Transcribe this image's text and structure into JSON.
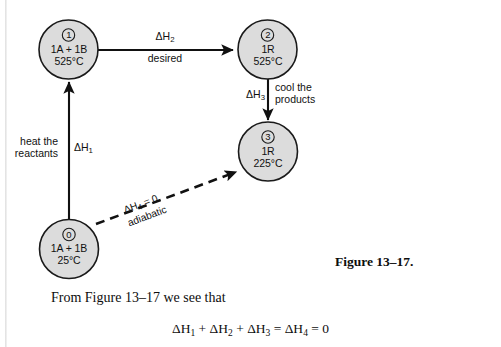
{
  "page": {
    "background": "#ffffff",
    "ink": "#111111",
    "circle_fill": "#dcdcdc",
    "circle_stroke": "#1a1a1a"
  },
  "diagram": {
    "nodes": [
      {
        "id": "state-1",
        "index": "1",
        "composition": "1A + 1B",
        "temperature": "525°C"
      },
      {
        "id": "state-2",
        "index": "2",
        "composition": "1R",
        "temperature": "525°C"
      },
      {
        "id": "state-3",
        "index": "3",
        "composition": "1R",
        "temperature": "225°C"
      },
      {
        "id": "state-0",
        "index": "0",
        "composition": "1A + 1B",
        "temperature": "25°C"
      }
    ],
    "edges": [
      {
        "id": "edge-dh2",
        "from": "state-1",
        "to": "state-2",
        "symbol": "ΔH",
        "subscript": "2",
        "description": "desired",
        "style": "solid"
      },
      {
        "id": "edge-dh3",
        "from": "state-2",
        "to": "state-3",
        "symbol": "ΔH",
        "subscript": "3",
        "description_line1": "cool the",
        "description_line2": "products",
        "style": "solid"
      },
      {
        "id": "edge-dh1",
        "from": "state-0",
        "to": "state-1",
        "symbol": "ΔH",
        "subscript": "1",
        "description_line1": "heat the",
        "description_line2": "reactants",
        "style": "solid"
      },
      {
        "id": "edge-dh4",
        "from": "state-0",
        "to": "state-3",
        "symbol": "ΔH",
        "subscript": "4",
        "value": " = 0",
        "description": "adiabatic",
        "style": "dashed"
      }
    ]
  },
  "caption": {
    "figure_label": "Figure 13–17."
  },
  "prose": {
    "intro_before": "From Figure 13–17 we see that"
  },
  "equation": {
    "t1": "ΔH",
    "s1": "1",
    "op1": " + ",
    "t2": "ΔH",
    "s2": "2",
    "op2": " + ",
    "t3": "ΔH",
    "s3": "3",
    "op3": " = ",
    "t4": "ΔH",
    "s4": "4",
    "op4": " = 0"
  }
}
